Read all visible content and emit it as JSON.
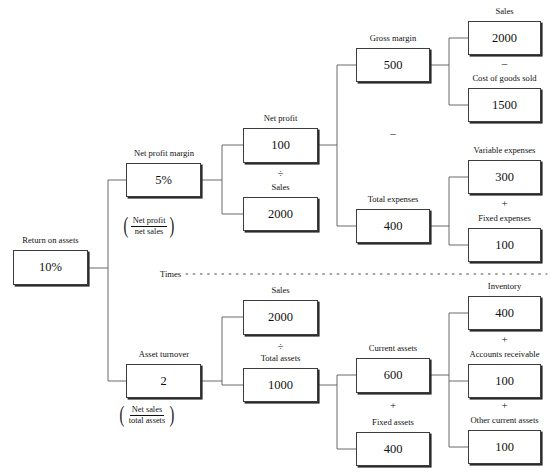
{
  "diagram": {
    "divider_label": "Times",
    "nodes": {
      "return_on_assets": {
        "caption": "Return on assets",
        "value": "10%"
      },
      "net_profit_margin": {
        "caption": "Net profit margin",
        "value": "5%"
      },
      "net_profit": {
        "caption": "Net profit",
        "value": "100"
      },
      "sales_top": {
        "caption": "Sales",
        "value": "2000"
      },
      "gross_margin": {
        "caption": "Gross margin",
        "value": "500"
      },
      "total_expenses": {
        "caption": "Total expenses",
        "value": "400"
      },
      "sales_gm": {
        "caption": "Sales",
        "value": "2000"
      },
      "cost_of_goods_sold": {
        "caption": "Cost of goods sold",
        "value": "1500"
      },
      "variable_expenses": {
        "caption": "Variable expenses",
        "value": "300"
      },
      "fixed_expenses": {
        "caption": "Fixed expenses",
        "value": "100"
      },
      "asset_turnover": {
        "caption": "Asset turnover",
        "value": "2"
      },
      "sales_bottom": {
        "caption": "Sales",
        "value": "2000"
      },
      "total_assets": {
        "caption": "Total assets",
        "value": "1000"
      },
      "current_assets": {
        "caption": "Current assets",
        "value": "600"
      },
      "fixed_assets": {
        "caption": "Fixed assets",
        "value": "400"
      },
      "inventory": {
        "caption": "Inventory",
        "value": "400"
      },
      "accounts_receivable": {
        "caption": "Accounts receivable",
        "value": "100"
      },
      "other_current_assets": {
        "caption": "Other current assets",
        "value": "100"
      }
    },
    "operators": {
      "divide_npm": "÷",
      "minus_gm_te": "–",
      "minus_sales_cogs": "–",
      "plus_var_fixed": "+",
      "divide_at": "÷",
      "plus_cur_fixed": "+",
      "plus_inv_ar": "+",
      "plus_ar_oca": "+"
    },
    "formulas": {
      "net_profit_margin": {
        "numerator": "Net profit",
        "denominator": "net sales"
      },
      "asset_turnover": {
        "numerator": "Net sales",
        "denominator": "total assets"
      }
    }
  }
}
